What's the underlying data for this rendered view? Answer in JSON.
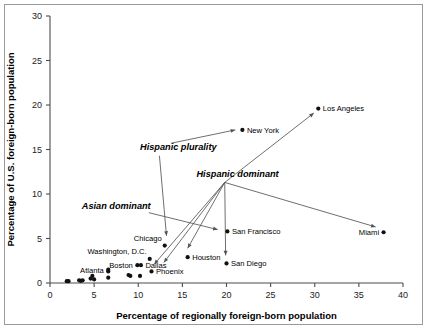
{
  "chart_data": {
    "type": "scatter",
    "title": "",
    "xlabel": "Percentage of regionally foreign-born population",
    "ylabel": "Percentage of U.S. foreign-born population",
    "xlim": [
      0,
      40
    ],
    "ylim": [
      0,
      30
    ],
    "xticks": [
      0,
      5,
      10,
      15,
      20,
      25,
      30,
      35,
      40
    ],
    "yticks": [
      0,
      5,
      10,
      15,
      20,
      25,
      30
    ],
    "xtick_labels": [
      "0",
      "5",
      "10",
      "15",
      "20",
      "25",
      "30",
      "35",
      "40"
    ],
    "ytick_labels": [
      "0",
      "5",
      "10",
      "15",
      "20",
      "25",
      "30"
    ],
    "grid": false,
    "legend": "none",
    "points": [
      {
        "label": "Los Angeles",
        "x": 30.4,
        "y": 19.6,
        "label_pos": "right"
      },
      {
        "label": "New York",
        "x": 21.8,
        "y": 17.2,
        "label_pos": "right"
      },
      {
        "label": "Miami",
        "x": 37.8,
        "y": 5.7,
        "label_pos": "left"
      },
      {
        "label": "San Francisco",
        "x": 20.1,
        "y": 5.8,
        "label_pos": "right"
      },
      {
        "label": "Chicago",
        "x": 13.0,
        "y": 4.2,
        "label_pos": "upleft"
      },
      {
        "label": "Houston",
        "x": 15.6,
        "y": 2.9,
        "label_pos": "right"
      },
      {
        "label": "Washington, D.C.",
        "x": 11.3,
        "y": 2.7,
        "label_pos": "upleft"
      },
      {
        "label": "San Diego",
        "x": 20.0,
        "y": 2.2,
        "label_pos": "right"
      },
      {
        "label": "Dallas",
        "x": 10.3,
        "y": 2.0,
        "label_pos": "right"
      },
      {
        "label": "Boston",
        "x": 9.9,
        "y": 2.0,
        "label_pos": "left"
      },
      {
        "label": "Phoenix",
        "x": 11.5,
        "y": 1.3,
        "label_pos": "right"
      },
      {
        "label": "Atlanta",
        "x": 6.6,
        "y": 1.5,
        "label_pos": "left"
      },
      {
        "label": "",
        "x": 6.6,
        "y": 1.3,
        "label_pos": "none"
      },
      {
        "label": "",
        "x": 8.9,
        "y": 0.9,
        "label_pos": "none"
      },
      {
        "label": "",
        "x": 9.1,
        "y": 0.8,
        "label_pos": "none"
      },
      {
        "label": "",
        "x": 10.2,
        "y": 0.8,
        "label_pos": "none"
      },
      {
        "label": "",
        "x": 6.6,
        "y": 0.6,
        "label_pos": "none"
      },
      {
        "label": "",
        "x": 5.0,
        "y": 0.4,
        "label_pos": "none"
      },
      {
        "label": "",
        "x": 4.8,
        "y": 0.8,
        "label_pos": "none"
      },
      {
        "label": "",
        "x": 4.6,
        "y": 0.5,
        "label_pos": "none"
      },
      {
        "label": "",
        "x": 3.7,
        "y": 0.3,
        "label_pos": "none"
      },
      {
        "label": "",
        "x": 3.5,
        "y": 0.25,
        "label_pos": "none"
      },
      {
        "label": "",
        "x": 3.3,
        "y": 0.3,
        "label_pos": "none"
      },
      {
        "label": "",
        "x": 1.9,
        "y": 0.2,
        "label_pos": "none"
      },
      {
        "label": "",
        "x": 2.1,
        "y": 0.2,
        "label_pos": "none"
      }
    ],
    "annotations": [
      {
        "text": "Hispanic plurality",
        "text_x": 10.2,
        "text_y": 15.0,
        "arrows": [
          {
            "from_x": 13.7,
            "from_y": 15.7,
            "to_x": 21.0,
            "to_y": 17.2
          },
          {
            "from_x": 12.4,
            "from_y": 14.3,
            "to_x": 13.2,
            "to_y": 5.3
          }
        ]
      },
      {
        "text": "Hispanic dominant",
        "text_x": 16.6,
        "text_y": 11.9,
        "arrows": [
          {
            "from_x": 19.8,
            "from_y": 11.3,
            "to_x": 29.9,
            "to_y": 19.1
          },
          {
            "from_x": 19.8,
            "from_y": 11.3,
            "to_x": 36.9,
            "to_y": 6.3
          },
          {
            "from_x": 19.8,
            "from_y": 11.3,
            "to_x": 19.9,
            "to_y": 3.1
          },
          {
            "from_x": 19.8,
            "from_y": 11.3,
            "to_x": 15.6,
            "to_y": 3.9
          },
          {
            "from_x": 19.8,
            "from_y": 11.3,
            "to_x": 12.9,
            "to_y": 2.3
          },
          {
            "from_x": 19.8,
            "from_y": 11.3,
            "to_x": 11.8,
            "to_y": 2.1
          }
        ]
      },
      {
        "text": "Asian dominant",
        "text_x": 3.6,
        "text_y": 8.3,
        "arrows": [
          {
            "from_x": 11.2,
            "from_y": 7.9,
            "to_x": 19.0,
            "to_y": 6.0
          }
        ]
      }
    ]
  }
}
